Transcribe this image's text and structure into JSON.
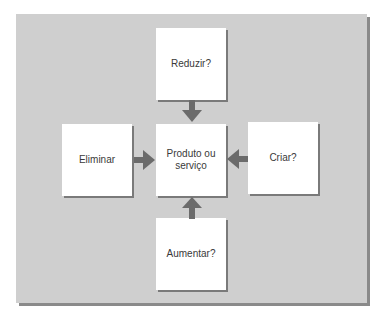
{
  "diagram": {
    "type": "four-actions-framework",
    "colors": {
      "panel": "#cfcfcf",
      "panel_shadow": "#8a8a8a",
      "box": "#ffffff",
      "arrow": "#6b6b6b",
      "text": "#3a3a3a"
    },
    "center": {
      "label_line1": "Produto ou",
      "label_line2": "serviço"
    },
    "boxes": {
      "top": {
        "label": "Reduzir?"
      },
      "left": {
        "label": "Eliminar"
      },
      "right": {
        "label": "Criar?"
      },
      "bottom": {
        "label": "Aumentar?"
      }
    },
    "arrows": [
      {
        "from": "Reduzir?",
        "to": "Produto ou serviço",
        "direction": "down"
      },
      {
        "from": "Eliminar",
        "to": "Produto ou serviço",
        "direction": "right"
      },
      {
        "from": "Criar?",
        "to": "Produto ou serviço",
        "direction": "left"
      },
      {
        "from": "Aumentar?",
        "to": "Produto ou serviço",
        "direction": "up"
      }
    ]
  }
}
